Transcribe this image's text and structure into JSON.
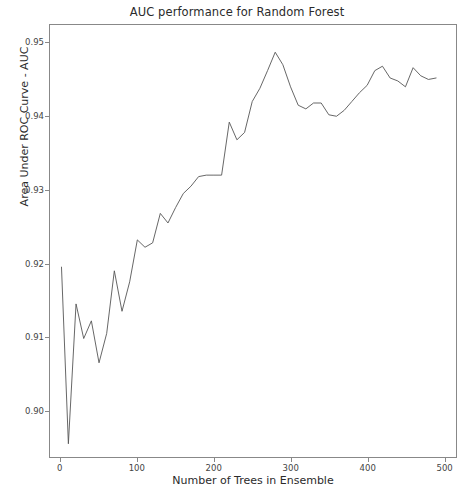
{
  "chart_data": {
    "type": "line",
    "title": "AUC performance for Random Forest",
    "xlabel": "Number of Trees in Ensemble",
    "ylabel": "Area Under ROC Curve - AUC",
    "xlim": [
      -14,
      516
    ],
    "ylim": [
      0.8937,
      0.9524
    ],
    "xticks": [
      0,
      100,
      200,
      300,
      400,
      500
    ],
    "xtick_labels": [
      "0",
      "100",
      "200",
      "300",
      "400",
      "500"
    ],
    "yticks": [
      0.9,
      0.91,
      0.92,
      0.93,
      0.94,
      0.95
    ],
    "ytick_labels": [
      "0.90",
      "0.91",
      "0.92",
      "0.93",
      "0.94",
      "0.95"
    ],
    "grid": false,
    "legend": null,
    "line_color": "#555555",
    "line_width": 0.9,
    "series": [
      {
        "name": "AUC",
        "x": [
          1,
          10,
          20,
          30,
          40,
          50,
          60,
          70,
          80,
          90,
          100,
          110,
          120,
          130,
          140,
          150,
          160,
          170,
          180,
          190,
          200,
          210,
          220,
          230,
          240,
          250,
          260,
          270,
          280,
          290,
          300,
          310,
          320,
          330,
          340,
          350,
          360,
          370,
          380,
          390,
          400,
          410,
          420,
          430,
          440,
          450,
          460,
          470,
          480,
          490
        ],
        "y": [
          0.9195,
          0.8955,
          0.9145,
          0.9098,
          0.9122,
          0.9065,
          0.9105,
          0.919,
          0.9135,
          0.9175,
          0.9232,
          0.9222,
          0.9228,
          0.9268,
          0.9255,
          0.9276,
          0.9295,
          0.9305,
          0.9318,
          0.932,
          0.932,
          0.932,
          0.9392,
          0.9368,
          0.9378,
          0.942,
          0.9438,
          0.9462,
          0.9487,
          0.947,
          0.944,
          0.9415,
          0.941,
          0.9418,
          0.9418,
          0.9402,
          0.94,
          0.9408,
          0.942,
          0.9432,
          0.9442,
          0.9462,
          0.9468,
          0.9452,
          0.9448,
          0.944,
          0.9466,
          0.9455,
          0.945,
          0.9452
        ]
      }
    ]
  },
  "figure": {
    "background_color": "#ffffff",
    "axes_color": "#888888"
  }
}
